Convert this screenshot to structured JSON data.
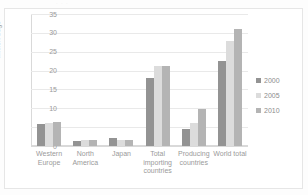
{
  "title_strip": "· · ·",
  "chart_data": {
    "type": "bar",
    "title": "",
    "xlabel": "",
    "ylabel": "Million bags",
    "ylim": [
      0,
      35
    ],
    "yticks": [
      35,
      30,
      25,
      20,
      15,
      10,
      5,
      0
    ],
    "grid": true,
    "legend_position": "right",
    "categories": [
      "Western Europe",
      "North America",
      "Japan",
      "Total importing countries",
      "Producing countries",
      "World total"
    ],
    "series": [
      {
        "name": "2000",
        "color": "#939393",
        "values": [
          5.8,
          1.2,
          2.0,
          18.1,
          4.5,
          22.6
        ]
      },
      {
        "name": "2005",
        "color": "#dcdcdc",
        "values": [
          6.0,
          1.5,
          1.7,
          21.2,
          6.2,
          27.8
        ]
      },
      {
        "name": "2010",
        "color": "#b4b4b4",
        "values": [
          6.3,
          1.7,
          1.7,
          21.2,
          9.7,
          31.0
        ]
      }
    ]
  }
}
